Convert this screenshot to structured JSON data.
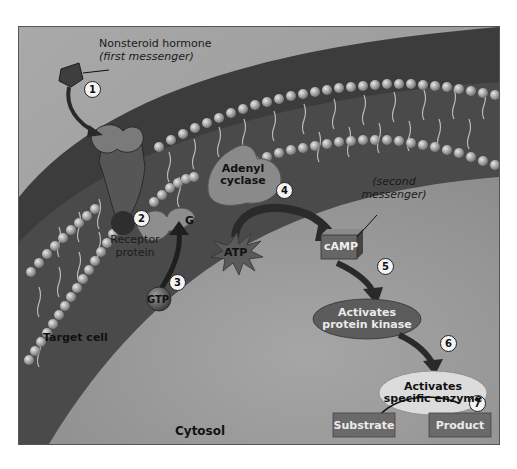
{
  "diagram": {
    "labels": {
      "hormone": "Nonsteroid hormone",
      "hormone_sub": "(first messenger)",
      "receptor_line1": "Receptor",
      "receptor_line2": "protein",
      "g_protein": "G",
      "gtp": "GTP",
      "adenyl_line1": "Adenyl",
      "adenyl_line2": "cyclase",
      "atp": "ATP",
      "camp": "cAMP",
      "second_line1": "(second",
      "second_line2": "messenger)",
      "kinase_line1": "Activates",
      "kinase_line2": "protein kinase",
      "enzyme_line1": "Activates",
      "enzyme_line2": "specific enzyme",
      "substrate": "Substrate",
      "product": "Product",
      "target_cell": "Target cell",
      "cytosol": "Cytosol"
    },
    "steps": [
      "1",
      "2",
      "3",
      "4",
      "5",
      "6",
      "7"
    ],
    "colors": {
      "background": "#9a9a9a",
      "membrane_dark": "#3a3a3a",
      "phospholipid_head": "#b0b0b0",
      "kinase_oval": "#5a5a5a",
      "enzyme_oval": "#dcdcdc",
      "box": "#6a6a6a"
    }
  }
}
